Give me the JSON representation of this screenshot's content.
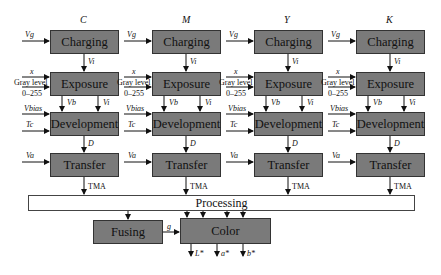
{
  "columns": [
    {
      "header": "C",
      "x": 50
    },
    {
      "header": "M",
      "x": 152
    },
    {
      "header": "Y",
      "x": 254
    },
    {
      "header": "K",
      "x": 356
    }
  ],
  "stages": {
    "charging": "Charging",
    "exposure": "Exposure",
    "development": "Development",
    "transfer": "Transfer"
  },
  "inputs": {
    "charging_in": "Vg",
    "exposure_x": "x",
    "gray_level": "Gray level",
    "gray_range": "0–255",
    "dev_bias": "Vbias",
    "dev_temp": "Tc",
    "transfer_in": "Va"
  },
  "signals": {
    "charging_to_exposure": "Vi",
    "exposure_out_b": "Vb",
    "exposure_out_i": "Vi",
    "development_to_transfer": "D",
    "transfer_out": "TMA"
  },
  "processing": {
    "label": "Processing"
  },
  "fusing": {
    "label": "Fusing",
    "output": "g"
  },
  "color": {
    "label": "Color",
    "outputs": [
      "L*",
      "a*",
      "b*"
    ]
  },
  "colors": {
    "box_fill": "#7a7a7a",
    "border": "#333333",
    "background": "#ffffff"
  }
}
